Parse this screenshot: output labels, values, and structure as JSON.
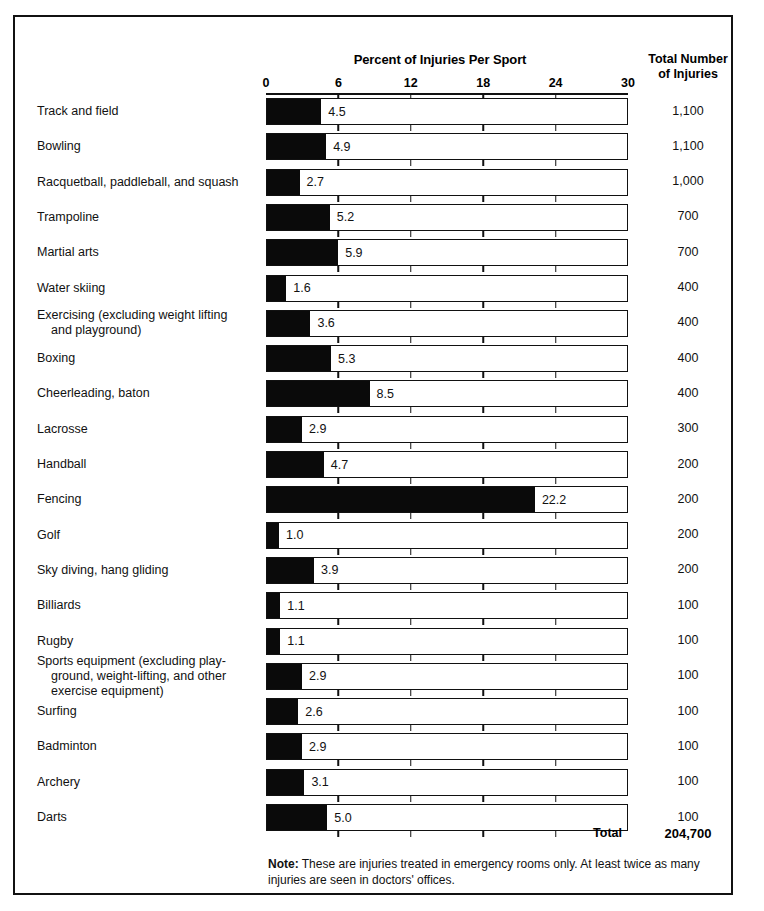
{
  "figure": {
    "title": "Percent of Injuries Per Sport",
    "totals_header_line1": "Total Number",
    "totals_header_line2": "of Injuries",
    "total_label": "Total",
    "total_value": "204,700",
    "note_lead": "Note:",
    "note_text": " These are injuries treated in emergency rooms only.  At least twice as many injuries are seen in doctors' offices."
  },
  "chart_data": {
    "type": "bar",
    "orientation": "horizontal",
    "title": "Percent of Injuries Per Sport",
    "xlabel": "",
    "ylabel": "",
    "xlim": [
      0,
      30
    ],
    "xticks": [
      0,
      6,
      12,
      18,
      24,
      30
    ],
    "xtick_labels": [
      "0",
      "6",
      "12",
      "18",
      "24",
      "30"
    ],
    "grid": false,
    "bar_color": "#0a0a0a",
    "track_color": "#ffffff",
    "value_column_header": "Total Number of Injuries",
    "total_injuries": "204,700",
    "categories": [
      "Track and field",
      "Bowling",
      "Racquetball, paddleball, and squash",
      "Trampoline",
      "Martial arts",
      "Water skiing",
      "Exercising (excluding weight lifting and playground)",
      "Boxing",
      "Cheerleading, baton",
      "Lacrosse",
      "Handball",
      "Fencing",
      "Golf",
      "Sky diving, hang gliding",
      "Billiards",
      "Rugby",
      "Sports equipment (excluding playground, weight-lifting, and other exercise equipment)",
      "Surfing",
      "Badminton",
      "Archery",
      "Darts"
    ],
    "values": [
      4.5,
      4.9,
      2.7,
      5.2,
      5.9,
      1.6,
      3.6,
      5.3,
      8.5,
      2.9,
      4.7,
      22.2,
      1.0,
      3.9,
      1.1,
      1.1,
      2.9,
      2.6,
      2.9,
      3.1,
      5.0
    ],
    "totals": [
      1100,
      1100,
      1000,
      700,
      700,
      400,
      400,
      400,
      400,
      300,
      200,
      200,
      200,
      200,
      100,
      100,
      100,
      100,
      100,
      100,
      100
    ]
  },
  "rows": [
    {
      "label_lines": [
        "Track and field"
      ],
      "value": "4.5",
      "pct": 4.5,
      "total": "1,100"
    },
    {
      "label_lines": [
        "Bowling"
      ],
      "value": "4.9",
      "pct": 4.9,
      "total": "1,100"
    },
    {
      "label_lines": [
        "Racquetball, paddleball, and squash"
      ],
      "value": "2.7",
      "pct": 2.7,
      "total": "1,000"
    },
    {
      "label_lines": [
        "Trampoline"
      ],
      "value": "5.2",
      "pct": 5.2,
      "total": "700"
    },
    {
      "label_lines": [
        "Martial arts"
      ],
      "value": "5.9",
      "pct": 5.9,
      "total": "700"
    },
    {
      "label_lines": [
        "Water skiing"
      ],
      "value": "1.6",
      "pct": 1.6,
      "total": "400"
    },
    {
      "label_lines": [
        "Exercising (excluding weight lifting",
        "and playground)"
      ],
      "value": "3.6",
      "pct": 3.6,
      "total": "400"
    },
    {
      "label_lines": [
        "Boxing"
      ],
      "value": "5.3",
      "pct": 5.3,
      "total": "400"
    },
    {
      "label_lines": [
        "Cheerleading, baton"
      ],
      "value": "8.5",
      "pct": 8.5,
      "total": "400"
    },
    {
      "label_lines": [
        "Lacrosse"
      ],
      "value": "2.9",
      "pct": 2.9,
      "total": "300"
    },
    {
      "label_lines": [
        "Handball"
      ],
      "value": "4.7",
      "pct": 4.7,
      "total": "200"
    },
    {
      "label_lines": [
        "Fencing"
      ],
      "value": "22.2",
      "pct": 22.2,
      "total": "200"
    },
    {
      "label_lines": [
        "Golf"
      ],
      "value": "1.0",
      "pct": 1.0,
      "total": "200"
    },
    {
      "label_lines": [
        "Sky diving, hang gliding"
      ],
      "value": "3.9",
      "pct": 3.9,
      "total": "200"
    },
    {
      "label_lines": [
        "Billiards"
      ],
      "value": "1.1",
      "pct": 1.1,
      "total": "100"
    },
    {
      "label_lines": [
        "Rugby"
      ],
      "value": "1.1",
      "pct": 1.1,
      "total": "100"
    },
    {
      "label_lines": [
        "Sports equipment (excluding play-",
        "ground, weight-lifting, and other",
        "exercise equipment)"
      ],
      "value": "2.9",
      "pct": 2.9,
      "total": "100"
    },
    {
      "label_lines": [
        "Surfing"
      ],
      "value": "2.6",
      "pct": 2.6,
      "total": "100"
    },
    {
      "label_lines": [
        "Badminton"
      ],
      "value": "2.9",
      "pct": 2.9,
      "total": "100"
    },
    {
      "label_lines": [
        "Archery"
      ],
      "value": "3.1",
      "pct": 3.1,
      "total": "100"
    },
    {
      "label_lines": [
        "Darts"
      ],
      "value": "5.0",
      "pct": 5.0,
      "total": "100"
    }
  ],
  "layout": {
    "plot_left": 266,
    "plot_width": 362,
    "first_bar_top": 98,
    "row_pitch": 35.3,
    "bar_height": 27
  }
}
